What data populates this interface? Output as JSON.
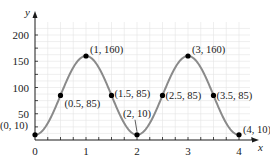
{
  "chart_data": {
    "type": "line",
    "title": "",
    "xlabel": "x",
    "ylabel": "y",
    "function_hint": "y = 85 - 75cos(pi x)",
    "xlim": [
      0,
      4
    ],
    "ylim": [
      0,
      200
    ],
    "grid": true,
    "legend": null,
    "x_ticks": [
      0,
      1,
      2,
      3,
      4
    ],
    "x_tick_labels": [
      "0",
      "1",
      "2",
      "3",
      "4"
    ],
    "y_ticks": [
      50,
      100,
      150,
      200
    ],
    "y_tick_labels": [
      "50",
      "100",
      "150",
      "200"
    ],
    "series": [
      {
        "name": "curve",
        "color": "#8a8a8a",
        "points": [
          {
            "x": 0,
            "y": 10,
            "label": "(0, 10)"
          },
          {
            "x": 0.5,
            "y": 85,
            "label": "(0.5, 85)"
          },
          {
            "x": 1,
            "y": 160,
            "label": "(1, 160)"
          },
          {
            "x": 1.5,
            "y": 85,
            "label": "(1.5, 85)"
          },
          {
            "x": 2,
            "y": 10,
            "label": "(2, 10)"
          },
          {
            "x": 2.5,
            "y": 85,
            "label": "(2.5, 85)"
          },
          {
            "x": 3,
            "y": 160,
            "label": "(3, 160)"
          },
          {
            "x": 3.5,
            "y": 85,
            "label": "(3.5, 85)"
          },
          {
            "x": 4,
            "y": 10,
            "label": "(4, 10)"
          }
        ]
      }
    ]
  },
  "layout": {
    "origin_px": [
      35,
      140
    ],
    "x_px_per_unit": 51,
    "y_px_per_unit": 0.525,
    "grid_top_px": 22,
    "grid_right_px": 250
  }
}
